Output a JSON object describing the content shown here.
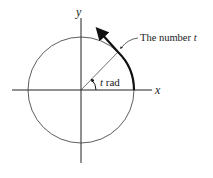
{
  "diagram": {
    "axis_x_label": "x",
    "axis_y_label": "y",
    "angle_label_var": "t",
    "angle_label_unit": " rad",
    "arc_label_text": "The number ",
    "arc_label_var": "t"
  }
}
